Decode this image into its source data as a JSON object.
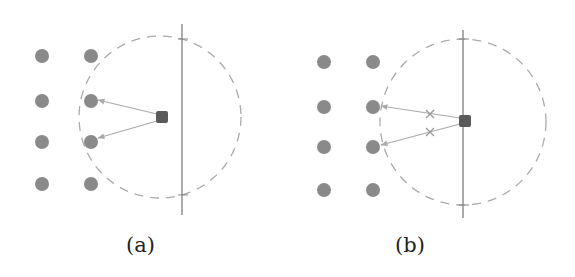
{
  "figure": {
    "panels": [
      {
        "id": "a",
        "caption": "(a)",
        "colors": {
          "node": "#8a8a8a",
          "agent": "#5a5a5a",
          "line": "#888888",
          "arrow": "#aaaaaa",
          "circle": "#aaaaaa"
        },
        "nodes": [
          {
            "x": 42,
            "y": 56
          },
          {
            "x": 91,
            "y": 56
          },
          {
            "x": 42,
            "y": 101
          },
          {
            "x": 91,
            "y": 101
          },
          {
            "x": 42,
            "y": 142
          },
          {
            "x": 91,
            "y": 142
          },
          {
            "x": 42,
            "y": 184
          },
          {
            "x": 91,
            "y": 184
          }
        ],
        "agent": {
          "x": 162,
          "y": 117
        },
        "wall": {
          "x": 182,
          "y1": 24,
          "y2": 215
        },
        "range_circle": {
          "cx": 160,
          "cy": 117,
          "r": 81
        },
        "arrows": [
          {
            "from": {
              "x": 157,
              "y": 114
            },
            "to": {
              "x": 98,
              "y": 100
            }
          },
          {
            "from": {
              "x": 157,
              "y": 121
            },
            "to": {
              "x": 98,
              "y": 138
            }
          }
        ],
        "intermediate_marks": []
      },
      {
        "id": "b",
        "caption": "(b)",
        "colors": {
          "node": "#8a8a8a",
          "agent": "#5a5a5a",
          "line": "#888888",
          "arrow": "#aaaaaa",
          "circle": "#aaaaaa"
        },
        "nodes": [
          {
            "x": 39,
            "y": 62
          },
          {
            "x": 88,
            "y": 62
          },
          {
            "x": 39,
            "y": 107
          },
          {
            "x": 88,
            "y": 107
          },
          {
            "x": 39,
            "y": 147
          },
          {
            "x": 88,
            "y": 147
          },
          {
            "x": 39,
            "y": 190
          },
          {
            "x": 88,
            "y": 190
          }
        ],
        "agent": {
          "x": 180,
          "y": 121
        },
        "wall": {
          "x": 178,
          "y1": 30,
          "y2": 218
        },
        "range_circle": {
          "cx": 178,
          "cy": 122,
          "r": 83
        },
        "arrows": [
          {
            "from": {
              "x": 175,
              "y": 118
            },
            "to": {
              "x": 96,
              "y": 106
            }
          },
          {
            "from": {
              "x": 175,
              "y": 124
            },
            "to": {
              "x": 96,
              "y": 145
            }
          }
        ],
        "intermediate_marks": [
          {
            "x": 145,
            "y": 114
          },
          {
            "x": 145,
            "y": 132
          }
        ]
      }
    ]
  }
}
